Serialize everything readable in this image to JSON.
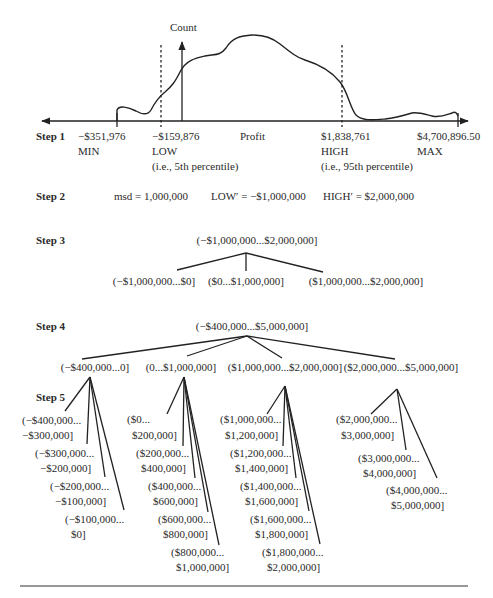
{
  "step1": {
    "label": "Step 1",
    "y_axis_label": "Count",
    "x_axis_label": "Profit",
    "markers": [
      {
        "name": "MIN",
        "value": "−$351,976",
        "note": ""
      },
      {
        "name": "LOW",
        "value": "−$159,876",
        "note": "(i.e., 5th percentile)"
      },
      {
        "name": "HIGH",
        "value": "$1,838,761",
        "note": "(i.e., 95th percentile)"
      },
      {
        "name": "MAX",
        "value": "$4,700,896.50",
        "note": ""
      }
    ]
  },
  "step2": {
    "label": "Step 2",
    "msd": "msd = 1,000,000",
    "low_prime": "LOW′ = −$1,000,000",
    "high_prime": "HIGH′ = $2,000,000"
  },
  "step3": {
    "label": "Step 3",
    "root": "(−$1,000,000...$2,000,000]",
    "children": [
      "(−$1,000,000...$0]",
      "($0...$1,000,000]",
      "($1,000,000...$2,000,000]"
    ]
  },
  "step4": {
    "label": "Step 4",
    "root": "(−$400,000...$5,000,000]",
    "children": [
      "(−$400,000...0]",
      "(0...$1,000,000]",
      "($1,000,000...$2,000,000]",
      "($2,000,000...$5,000,000]"
    ]
  },
  "step5": {
    "label": "Step 5",
    "groups": [
      [
        [
          "(−$400,000...",
          "−$300,000]"
        ],
        [
          "(−$300,000...",
          "−$200,000]"
        ],
        [
          "(−$200,000...",
          "−$100,000]"
        ],
        [
          "(−$100,000...",
          "$0]"
        ]
      ],
      [
        [
          "($0...",
          "$200,000]"
        ],
        [
          "($200,000...",
          "$400,000]"
        ],
        [
          "($400,000...",
          "$600,000]"
        ],
        [
          "($600,000...",
          "$800,000]"
        ],
        [
          "($800,000...",
          "$1,000,000]"
        ]
      ],
      [
        [
          "($1,000,000...",
          "$1,200,000]"
        ],
        [
          "($1,200,000...",
          "$1,400,000]"
        ],
        [
          "($1,400,000...",
          "$1,600,000]"
        ],
        [
          "($1,600,000...",
          "$1,800,000]"
        ],
        [
          "($1,800,000...",
          "$2,000,000]"
        ]
      ],
      [
        [
          "($2,000,000...",
          "$3,000,000]"
        ],
        [
          "($3,000,000...",
          "$4,000,000]"
        ],
        [
          "($4,000,000...",
          "$5,000,000]"
        ]
      ]
    ]
  }
}
